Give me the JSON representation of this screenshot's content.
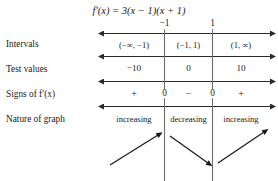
{
  "figure": {
    "title": {
      "func": "f",
      "prime": "′",
      "arg": "(x)",
      "equals": " = ",
      "expr": "3(x − 1)(x + 1)",
      "full": "f′(x) = 3(x − 1)(x + 1)"
    },
    "row_labels": [
      {
        "id": "intervals",
        "text": "Intervals"
      },
      {
        "id": "test-values",
        "text": "Test values"
      },
      {
        "id": "signs",
        "text_before": "Signs of ",
        "func": "f",
        "prime": "′",
        "arg": "(x)",
        "full": "Signs of f′(x)"
      },
      {
        "id": "nature",
        "text": "Nature of graph"
      }
    ],
    "boundaries": [
      {
        "id": "left-critical",
        "label": "−1"
      },
      {
        "id": "right-critical",
        "label": "1"
      }
    ],
    "intervals": [
      {
        "id": "left",
        "label": "(−∞, −1)"
      },
      {
        "id": "middle",
        "label": "(−1, 1)"
      },
      {
        "id": "right",
        "label": "(1, ∞)"
      }
    ],
    "test_values": [
      {
        "id": "left",
        "label": "−10"
      },
      {
        "id": "middle",
        "label": "0"
      },
      {
        "id": "right",
        "label": "10"
      }
    ],
    "signs": [
      {
        "id": "left",
        "label": "+"
      },
      {
        "id": "left-critical",
        "label": "0"
      },
      {
        "id": "middle",
        "label": "−"
      },
      {
        "id": "right-critical",
        "label": "0"
      },
      {
        "id": "right",
        "label": "+"
      }
    ],
    "nature": [
      {
        "id": "left",
        "label": "increasing"
      },
      {
        "id": "middle",
        "label": "decreasing"
      },
      {
        "id": "right",
        "label": "increasing"
      }
    ],
    "trend_arrows": [
      {
        "id": "left",
        "direction": "up-right"
      },
      {
        "id": "middle",
        "direction": "down-right"
      },
      {
        "id": "right",
        "direction": "up-right"
      }
    ],
    "colors": {
      "ink": "#1a1a1a",
      "rule": "#2b2b2b",
      "background": "#ffffff"
    }
  }
}
